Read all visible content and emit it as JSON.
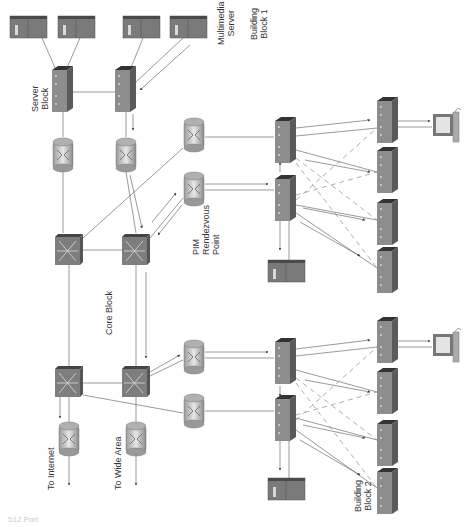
{
  "labels": {
    "server_block": [
      "Server",
      "Block"
    ],
    "multimedia_server": [
      "Multimedia",
      "Server"
    ],
    "building_block_1": [
      "Building",
      "Block 1"
    ],
    "building_block_2": [
      "Building",
      "Block 2"
    ],
    "pim_rp": [
      "PIM",
      "Rendezvous",
      "Point"
    ],
    "core_block": "Core Block",
    "to_internet": "To Internet",
    "to_wide_area": "To Wide Area",
    "caption": "512 Port"
  },
  "devices": {
    "servers": [
      "server-1",
      "server-2",
      "server-3",
      "multimedia-server",
      "block1-server",
      "block2-server"
    ],
    "layer3_switches": [
      "core-switch-1",
      "core-switch-2",
      "core-switch-3",
      "core-switch-4"
    ],
    "routers": [
      "server-router-1",
      "server-router-2",
      "pim-router",
      "block1-router",
      "block2-router-1",
      "block2-router-2",
      "internet-router",
      "wan-router"
    ],
    "workgroup_switches": [
      "server-switch-1",
      "server-switch-2",
      "dist-1a",
      "dist-1b",
      "dist-2a",
      "dist-2b",
      "access-1a",
      "access-1b",
      "access-1c",
      "access-1d",
      "access-2a",
      "access-2b",
      "access-2c",
      "access-2d"
    ],
    "workstations": [
      "pc-block1",
      "pc-block2"
    ]
  },
  "colors": {
    "device_face": "#8a8a8a",
    "device_top": "#3a3a3a",
    "device_side": "#6e6e6e",
    "line": "#555555"
  }
}
